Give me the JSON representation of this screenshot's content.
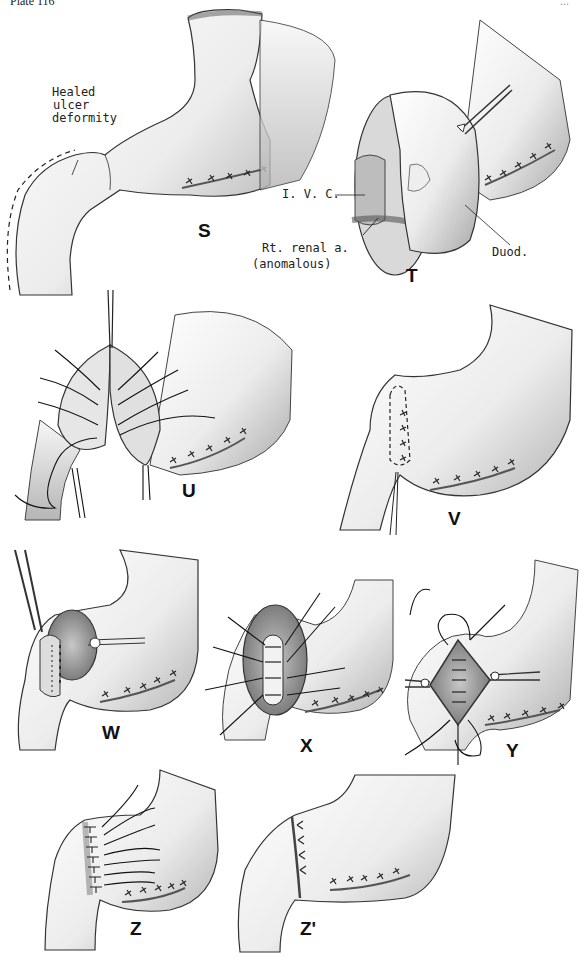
{
  "header": {
    "plate": "Plate 116",
    "page": "..."
  },
  "panels": {
    "S": {
      "label": "S",
      "annotations": {
        "heal1": "Healed",
        "heal2": "ulcer",
        "heal3": "deformity"
      }
    },
    "T": {
      "label": "T",
      "annotations": {
        "ivc": "I. V. C.",
        "renal1": "Rt. renal a.",
        "renal2": "(anomalous)",
        "duod": "Duod."
      }
    },
    "U": {
      "label": "U"
    },
    "V": {
      "label": "V"
    },
    "W": {
      "label": "W"
    },
    "X": {
      "label": "X"
    },
    "Y": {
      "label": "Y"
    },
    "Z": {
      "label": "Z"
    },
    "Z2": {
      "label": "Z'"
    }
  }
}
